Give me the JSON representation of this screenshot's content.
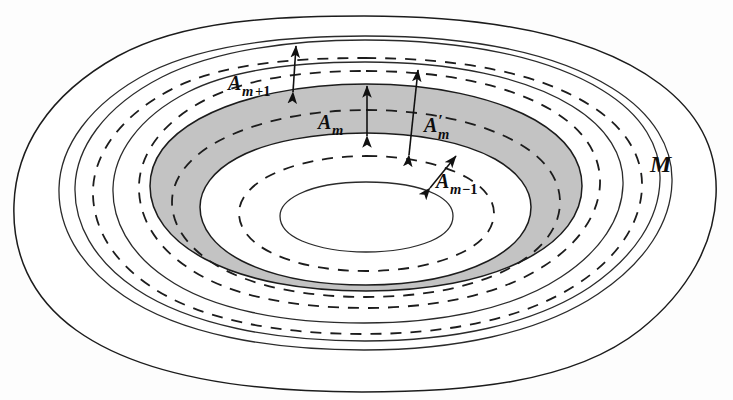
{
  "figure": {
    "background_color": "#fdfdfd",
    "shaded_band_color": "#c3c3c3",
    "line_color": "#1c1c1c",
    "labels": {
      "outer_set": "M",
      "band_outer": {
        "base": "A",
        "sub_var": "m",
        "sub_op": "+1"
      },
      "band_shaded": {
        "base": "A",
        "sub_var": "m"
      },
      "band_prime": {
        "base": "A",
        "prime": "′",
        "sub_var": "m"
      },
      "band_inner": {
        "base": "A",
        "sub_var": "m",
        "sub_op": "−1"
      }
    },
    "annotations": [
      {
        "name": "A_m+1",
        "kind": "double-arrow",
        "orientation": "vertical",
        "measures": "white band between outer solid contour and shaded band"
      },
      {
        "name": "A_m",
        "kind": "double-arrow",
        "orientation": "vertical",
        "measures": "width of shaded band"
      },
      {
        "name": "A'_m",
        "kind": "double-arrow",
        "orientation": "slanted",
        "measures": "span between outer dashed and inner dashed contours"
      },
      {
        "name": "A_m-1",
        "kind": "double-arrow",
        "orientation": "diagonal",
        "measures": "white band inside shaded band"
      }
    ],
    "contours": [
      {
        "id": "outer-boundary-M",
        "style": "solid",
        "shape": "teardrop"
      },
      {
        "id": "contour-2",
        "style": "solid",
        "shape": "oval"
      },
      {
        "id": "contour-3-dashed",
        "style": "dashed",
        "shape": "oval"
      },
      {
        "id": "contour-4",
        "style": "solid",
        "shape": "oval"
      },
      {
        "id": "contour-5-dashed",
        "style": "dashed",
        "shape": "oval"
      },
      {
        "id": "shaded-band-outer-edge",
        "style": "solid",
        "shape": "oval"
      },
      {
        "id": "contour-7-dashed",
        "style": "dashed",
        "shape": "oval"
      },
      {
        "id": "shaded-band-inner-edge",
        "style": "solid",
        "shape": "oval"
      },
      {
        "id": "contour-9-dashed",
        "style": "dashed",
        "shape": "oval"
      },
      {
        "id": "innermost-ellipse",
        "style": "solid",
        "shape": "ellipse"
      }
    ]
  }
}
